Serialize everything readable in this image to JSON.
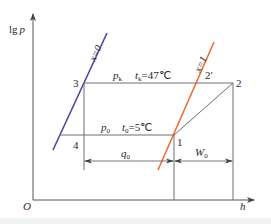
{
  "diagram": {
    "axes": {
      "y_label_prefix": "lg",
      "y_label_var": "p",
      "x_label": "h",
      "origin": "O"
    },
    "curves": {
      "saturated_liquid": {
        "label": "x=0",
        "color": "#4a4a9c"
      },
      "saturated_vapor": {
        "label": "x=1",
        "color": "#ef6a2e"
      }
    },
    "points": {
      "p1": "1",
      "p2": "2",
      "p2prime": "2′",
      "p3": "3",
      "p4": "4"
    },
    "isobars": {
      "condensing": {
        "p_var": "p",
        "p_sub": "k",
        "t_var": "t",
        "t_sub": "k",
        "t_value": "=47℃"
      },
      "evaporating": {
        "p_var": "p",
        "p_sub": "0",
        "t_var": "t",
        "t_sub": "0",
        "t_value": "=5℃"
      }
    },
    "dimensions": {
      "q0": {
        "var": "q",
        "sub": "0"
      },
      "w0": {
        "var": "W",
        "sub": "0"
      }
    },
    "colors": {
      "line": "#6e6e6e",
      "axis": "#555555",
      "liquid_line": "#4a4a9c",
      "vapor_line": "#ef6a2e"
    }
  }
}
